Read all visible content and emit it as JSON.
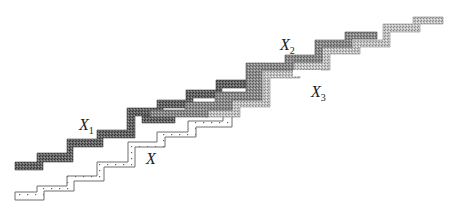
{
  "diagram": {
    "type": "staircase-band-diagram",
    "labels": [
      {
        "id": "X1",
        "text": "X",
        "sub": "1",
        "x": 79,
        "y": 117
      },
      {
        "id": "X",
        "text": "X",
        "sub": "",
        "x": 146,
        "y": 151
      },
      {
        "id": "X2",
        "text": "X",
        "sub": "2",
        "x": 280,
        "y": 37
      },
      {
        "id": "X3",
        "text": "X",
        "sub": "3",
        "x": 311,
        "y": 84
      }
    ],
    "colors": {
      "dark_band": "#555555",
      "medium_band": "#8a8a8a",
      "light_band": "#b8b8b8",
      "dotted_outline": "#777777",
      "background": "#ffffff"
    },
    "bands": [
      {
        "name": "X",
        "style": "dotted-outline"
      },
      {
        "name": "X1",
        "style": "dark-crosshatch"
      },
      {
        "name": "X2",
        "style": "dark-crosshatch"
      },
      {
        "name": "X3",
        "style": "light-crosshatch"
      }
    ]
  }
}
